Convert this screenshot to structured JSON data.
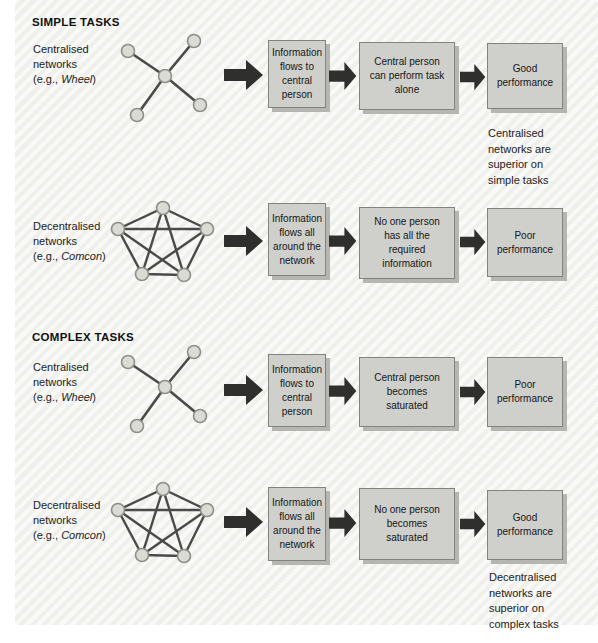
{
  "sections": {
    "simple": {
      "header": "SIMPLE TASKS"
    },
    "complex": {
      "header": "COMPLEX TASKS"
    }
  },
  "rows": [
    {
      "label_line1": "Centralised",
      "label_line2": "networks",
      "eg_prefix": "(e.g., ",
      "eg_name": "Wheel",
      "eg_suffix": ")",
      "network": "wheel",
      "box1": "Information flows to central person",
      "box2": "Central person can perform task alone",
      "box3": "Good performance",
      "caption": "Centralised networks are superior on simple tasks"
    },
    {
      "label_line1": "Decentralised",
      "label_line2": "networks",
      "eg_prefix": "(e.g., ",
      "eg_name": "Comcon",
      "eg_suffix": ")",
      "network": "comcon",
      "box1": "Information flows all around the network",
      "box2": "No one person has all the required information",
      "box3": "Poor performance"
    },
    {
      "label_line1": "Centralised",
      "label_line2": "networks",
      "eg_prefix": "(e.g., ",
      "eg_name": "Wheel",
      "eg_suffix": ")",
      "network": "wheel",
      "box1": "Information flows to central person",
      "box2": "Central person becomes saturated",
      "box3": "Poor performance"
    },
    {
      "label_line1": "Decentralised",
      "label_line2": "networks",
      "eg_prefix": "(e.g., ",
      "eg_name": "Comcon",
      "eg_suffix": ")",
      "network": "comcon",
      "box1": "Information flows all around the network",
      "box2": "No one person becomes saturated",
      "box3": "Good performance",
      "caption": "Decentralised networks are superior on complex tasks"
    }
  ],
  "colors": {
    "panel_bg": "#f3f3f0",
    "box_fill": "#cfcfcb",
    "box_border": "#82827e",
    "box_shadow": "#b5b5b1",
    "arrow": "#2f2f2d",
    "network_edge": "#4a4a48",
    "node_fill": "#dbdbd5",
    "node_border": "#8f8f89",
    "text": "#1c1c1c"
  }
}
